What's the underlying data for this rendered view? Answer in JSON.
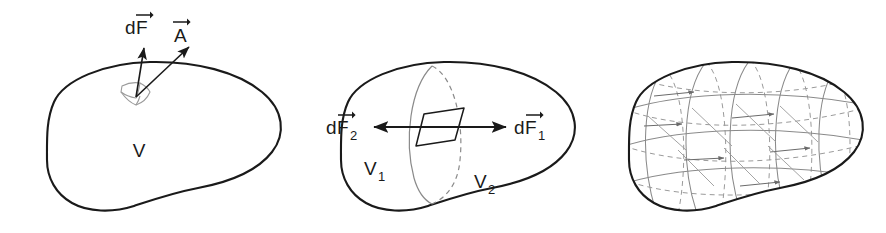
{
  "figure": {
    "domain": "diagram",
    "background_color": "#ffffff",
    "ink_color": "#1a1a1a",
    "faint_color": "#8a8a8a",
    "panel_count": 3
  },
  "panels": [
    {
      "id": "panel-volume-surface-element",
      "caption": "",
      "volume_label": "V",
      "surface_element": {
        "name": "surface-patch",
        "style": "faint-curved-quadrilateral"
      },
      "vectors": [
        {
          "name": "force-vector",
          "label_prefix": "d",
          "label_symbol": "F",
          "label_subscript": "",
          "has_overarrow": true,
          "direction": "up"
        },
        {
          "name": "area-vector",
          "label_prefix": "",
          "label_symbol": "A",
          "label_subscript": "",
          "has_overarrow": true,
          "direction": "up-right"
        }
      ]
    },
    {
      "id": "panel-volume-split-in-two",
      "caption": "",
      "subvolume_labels": [
        {
          "symbol": "V",
          "subscript": "1"
        },
        {
          "symbol": "V",
          "subscript": "2"
        }
      ],
      "internal_surface": {
        "name": "dividing-surface",
        "style": "ellipse-solid-front-dashed-back"
      },
      "surface_element": {
        "name": "interface-patch",
        "style": "solid-parallelogram"
      },
      "vectors": [
        {
          "name": "force-vector-2",
          "label_prefix": "d",
          "label_symbol": "F",
          "label_subscript": "2",
          "has_overarrow": true,
          "direction": "left"
        },
        {
          "name": "force-vector-1",
          "label_prefix": "d",
          "label_symbol": "F",
          "label_subscript": "1",
          "has_overarrow": true,
          "direction": "right"
        }
      ]
    },
    {
      "id": "panel-volume-subdivided-grid",
      "caption": "",
      "volume_label": "",
      "subdivision": {
        "name": "cell-grid",
        "style": "solid-front-dashed-back-curves",
        "longitudinal_curves": 5,
        "latitudinal_curves": 4,
        "internal_arrow_count": 6
      }
    }
  ],
  "labels": {
    "dF": "dF",
    "A": "A",
    "V": "V",
    "V1_symbol": "V",
    "V1_sub": "1",
    "V2_symbol": "V",
    "V2_sub": "2",
    "dF1_prefix": "d",
    "dF1_symbol": "F",
    "dF1_sub": "1",
    "dF2_prefix": "d",
    "dF2_symbol": "F",
    "dF2_sub": "2",
    "dF_prefix": "d",
    "dF_symbol": "F"
  }
}
